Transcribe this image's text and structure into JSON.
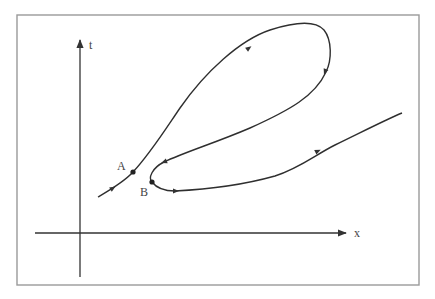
{
  "diagram": {
    "type": "spacetime-diagram",
    "axes": {
      "vertical_label": "t",
      "horizontal_label": "x"
    },
    "points": [
      {
        "label": "A",
        "description": "event on worldline before loop"
      },
      {
        "label": "B",
        "description": "event at turning point of loop"
      }
    ],
    "colors": {
      "frame": "#9a9a9a",
      "ink": "#2f2f2f",
      "background": "#ffffff"
    }
  }
}
